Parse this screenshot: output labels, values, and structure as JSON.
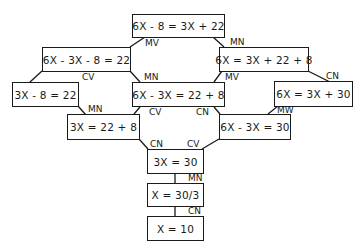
{
  "diagram": {
    "nodes": [
      {
        "id": "n1",
        "text": "6X - 8 = 3X + 22"
      },
      {
        "id": "n2",
        "text": "6X - 3X - 8 = 22"
      },
      {
        "id": "n3",
        "text": "6X = 3X + 22 + 8"
      },
      {
        "id": "n4",
        "text": "3X - 8 = 22"
      },
      {
        "id": "n5",
        "text": "6X - 3X = 22 + 8"
      },
      {
        "id": "n6",
        "text": "6X = 3X + 30"
      },
      {
        "id": "n7",
        "text": "3X = 22 + 8"
      },
      {
        "id": "n8",
        "text": "6X - 3X = 30"
      },
      {
        "id": "n9",
        "text": "3X = 30"
      },
      {
        "id": "n10",
        "text": "X = 30/3"
      },
      {
        "id": "n11",
        "text": "X = 10"
      }
    ],
    "edge_labels": [
      {
        "from": "n1",
        "to": "n2",
        "label": "MV"
      },
      {
        "from": "n1",
        "to": "n3",
        "label": "MN"
      },
      {
        "from": "n2",
        "to": "n4",
        "label": "CV"
      },
      {
        "from": "n2",
        "to": "n5",
        "label": "MN"
      },
      {
        "from": "n3",
        "to": "n5",
        "label": "MV"
      },
      {
        "from": "n3",
        "to": "n6",
        "label": "CN"
      },
      {
        "from": "n4",
        "to": "n7",
        "label": "MN"
      },
      {
        "from": "n5",
        "to": "n7",
        "label": "CV"
      },
      {
        "from": "n5",
        "to": "n8",
        "label": "CN"
      },
      {
        "from": "n6",
        "to": "n8",
        "label": "MW"
      },
      {
        "from": "n7",
        "to": "n9",
        "label": "CN"
      },
      {
        "from": "n8",
        "to": "n9",
        "label": "CV"
      },
      {
        "from": "n9",
        "to": "n10",
        "label": "MN"
      },
      {
        "from": "n10",
        "to": "n11",
        "label": "CN"
      }
    ]
  }
}
